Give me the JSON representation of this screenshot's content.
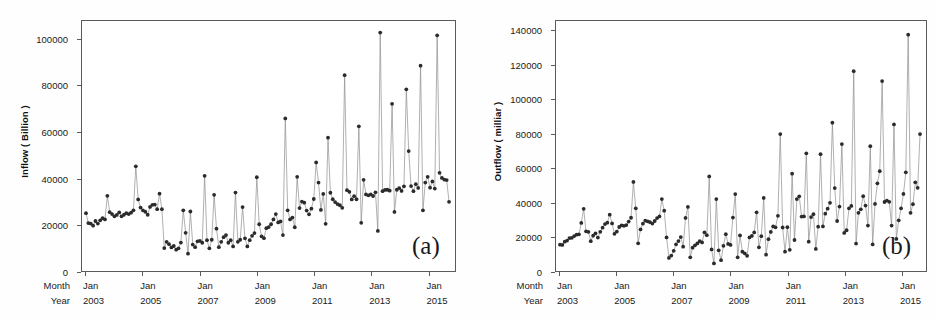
{
  "figure": {
    "background": "#ffffff",
    "frame_color": "#5a5a5a",
    "line_color": "#8d8d8d",
    "marker_color": "#2b2b2b"
  },
  "panels": [
    {
      "tag": "(a)",
      "ylabel": "Inflow ( Billion )",
      "xrow1_head": "Month",
      "xrow2_head": "Year",
      "yticks": [
        "0",
        "20000",
        "40000",
        "60000",
        "80000",
        "100000"
      ],
      "xticks_month": [
        "Jan",
        "Jan",
        "Jan",
        "Jan",
        "Jan",
        "Jan",
        "Jan"
      ],
      "xticks_year": [
        "2003",
        "2005",
        "2007",
        "2009",
        "2011",
        "2013",
        "2015"
      ]
    },
    {
      "tag": "(b)",
      "ylabel": "Outflow ( milliar )",
      "xrow1_head": "Month",
      "xrow2_head": "Year",
      "yticks": [
        "0",
        "20000",
        "40000",
        "60000",
        "80000",
        "100000",
        "120000",
        "140000"
      ],
      "xticks_month": [
        "Jan",
        "Jan",
        "Jan",
        "Jan",
        "Jan",
        "Jan",
        "Jan"
      ],
      "xticks_year": [
        "2003",
        "2005",
        "2007",
        "2009",
        "2011",
        "2013",
        "2015"
      ]
    }
  ],
  "chart_data": [
    {
      "type": "line",
      "title": "",
      "subtitle": "(a)",
      "xlabel": "Month / Year",
      "ylabel": "Inflow ( Billion )",
      "ylim": [
        0,
        108000
      ],
      "ytick_values": [
        0,
        20000,
        40000,
        60000,
        80000,
        100000
      ],
      "grid": false,
      "legend": "none",
      "marker": "filled-circle",
      "x_start": "2003-01",
      "x_end": "2016-06",
      "x_freq": "monthly",
      "xtick_labels": [
        "Jan 2003",
        "Jan 2005",
        "Jan 2007",
        "Jan 2009",
        "Jan 2011",
        "Jan 2013",
        "Jan 2015"
      ],
      "series": [
        {
          "name": "Inflow",
          "values": [
            25000,
            20700,
            20500,
            19600,
            21600,
            20500,
            21900,
            22800,
            22300,
            32500,
            25400,
            24600,
            23600,
            24200,
            25300,
            23600,
            24300,
            25000,
            24600,
            25200,
            26200,
            45200,
            30900,
            27400,
            26200,
            25600,
            24300,
            27700,
            28600,
            28700,
            26700,
            33400,
            26700,
            9900,
            12600,
            11600,
            10200,
            10800,
            9200,
            9800,
            12300,
            26200,
            16500,
            7500,
            25700,
            11400,
            10300,
            12800,
            13000,
            12200,
            41100,
            13300,
            9800,
            13500,
            32900,
            18300,
            10300,
            12600,
            14600,
            15500,
            12200,
            13300,
            10600,
            33900,
            12600,
            13500,
            27600,
            14100,
            10600,
            13300,
            15200,
            16400,
            40500,
            20200,
            15000,
            14200,
            18500,
            19000,
            20200,
            22300,
            24600,
            21000,
            21400,
            15500,
            65900,
            26200,
            22300,
            23100,
            18900,
            40700,
            27200,
            30000,
            29500,
            26100,
            24500,
            26900,
            31100,
            46900,
            38200,
            26400,
            33300,
            20400,
            57600,
            33800,
            31000,
            29800,
            28900,
            28400,
            27300,
            84600,
            34900,
            34200,
            30900,
            32300,
            31000,
            62500,
            20800,
            39400,
            33100,
            32700,
            33100,
            32400,
            34000,
            17300,
            103000,
            34500,
            35000,
            35100,
            34700,
            72200,
            25500,
            35100,
            35800,
            34600,
            36600,
            78500,
            51800,
            36700,
            34500,
            37500,
            35900,
            88700,
            26200,
            38200,
            40700,
            36000,
            38700,
            35600,
            101800,
            42400,
            40200,
            39500,
            39300,
            29900
          ]
        }
      ]
    },
    {
      "type": "line",
      "title": "",
      "subtitle": "(b)",
      "xlabel": "Month / Year",
      "ylabel": "Outflow ( milliar )",
      "ylim": [
        0,
        146000
      ],
      "ytick_values": [
        0,
        20000,
        40000,
        60000,
        80000,
        100000,
        120000,
        140000
      ],
      "grid": false,
      "legend": "none",
      "marker": "filled-circle",
      "x_start": "2003-01",
      "x_end": "2016-06",
      "x_freq": "monthly",
      "xtick_labels": [
        "Jan 2003",
        "Jan 2005",
        "Jan 2007",
        "Jan 2009",
        "Jan 2011",
        "Jan 2013",
        "Jan 2015"
      ],
      "series": [
        {
          "name": "Outflow",
          "values": [
            15400,
            15200,
            17100,
            17800,
            19200,
            19400,
            20400,
            21200,
            21400,
            28100,
            36300,
            23200,
            22900,
            17400,
            20600,
            22000,
            19500,
            22900,
            25300,
            27400,
            28200,
            32900,
            27800,
            21700,
            23000,
            25700,
            26700,
            26400,
            26800,
            28900,
            31100,
            52000,
            36600,
            16200,
            24300,
            27600,
            29400,
            29000,
            28500,
            27700,
            29200,
            30900,
            31900,
            42000,
            35200,
            19600,
            7600,
            9000,
            11800,
            15600,
            17500,
            19800,
            14200,
            31000,
            37400,
            8000,
            13600,
            15000,
            16100,
            17400,
            16700,
            22600,
            20900,
            55200,
            12600,
            4400,
            42000,
            12100,
            6300,
            14700,
            21500,
            15800,
            15200,
            31200,
            44900,
            8000,
            20800,
            11300,
            10300,
            8900,
            19600,
            20500,
            22500,
            34300,
            13800,
            20300,
            42700,
            9500,
            18600,
            22800,
            26000,
            25500,
            32200,
            80000,
            25400,
            11300,
            25600,
            12400,
            56800,
            18100,
            42000,
            43600,
            31800,
            31900,
            68700,
            17100,
            31500,
            33200,
            12900,
            25900,
            68200,
            26000,
            33500,
            36400,
            39800,
            86600,
            48400,
            29200,
            37600,
            74100,
            22200,
            23800,
            36600,
            38000,
            116700,
            16000,
            34000,
            36000,
            43700,
            38200,
            26500,
            72900,
            15500,
            39200,
            51200,
            58300,
            110900,
            40300,
            41100,
            40400,
            26500,
            85600,
            18700,
            29600,
            36600,
            45000,
            57600,
            138000,
            34000,
            39000,
            51800,
            48600,
            80000
          ]
        }
      ]
    }
  ]
}
